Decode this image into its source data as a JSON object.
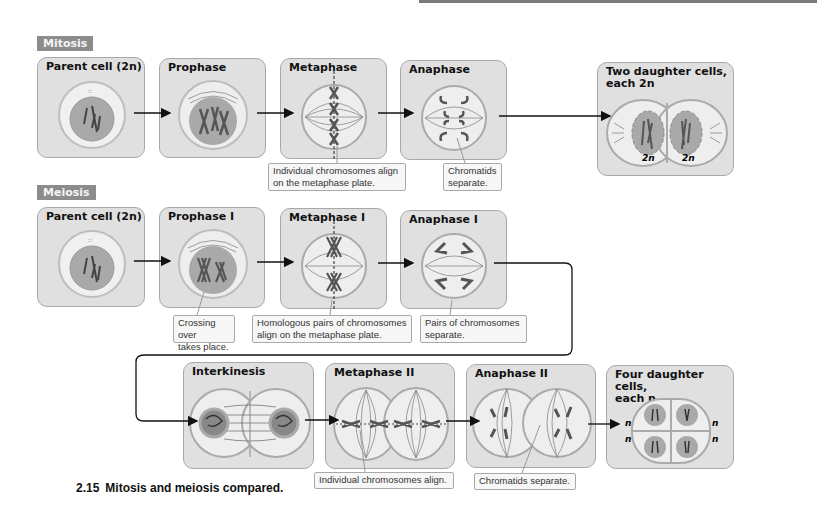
{
  "figure": {
    "caption_number": "2.15",
    "caption_text": "Mitosis and meiosis compared."
  },
  "mitosis": {
    "section_label": "Mitosis",
    "stages": [
      {
        "title": "Parent cell (2n)"
      },
      {
        "title": "Prophase"
      },
      {
        "title": "Metaphase"
      },
      {
        "title": "Anaphase"
      },
      {
        "title": "Two daughter cells,\neach 2n"
      }
    ],
    "daughter_labels": [
      "2n",
      "2n"
    ],
    "callouts": [
      {
        "text": "Individual chromosomes align\non the metaphase plate."
      },
      {
        "text": "Chromatids\nseparate."
      }
    ]
  },
  "meiosis": {
    "section_label": "Meiosis",
    "stages": [
      {
        "title": "Parent cell (2n)"
      },
      {
        "title": "Prophase I"
      },
      {
        "title": "Metaphase I"
      },
      {
        "title": "Anaphase I"
      },
      {
        "title": "Interkinesis"
      },
      {
        "title": "Metaphase II"
      },
      {
        "title": "Anaphase II"
      },
      {
        "title": "Four daughter cells,\neach n"
      }
    ],
    "daughter_labels": [
      "n",
      "n",
      "n",
      "n"
    ],
    "callouts": [
      {
        "text": "Crossing over\ntakes place."
      },
      {
        "text": "Homologous pairs of chromosomes\nalign on the metaphase plate."
      },
      {
        "text": "Pairs of chromosomes\nseparate."
      },
      {
        "text": "Individual chromosomes align."
      },
      {
        "text": "Chromatids separate."
      }
    ]
  },
  "colors": {
    "panel_bg": "#e0e0e0",
    "panel_border": "#a8a8a8",
    "section_label_bg": "#8c8c8c",
    "nucleus": "#a9a9a9",
    "cytoplasm": "#eeeeee",
    "chromosome": "#555555"
  }
}
